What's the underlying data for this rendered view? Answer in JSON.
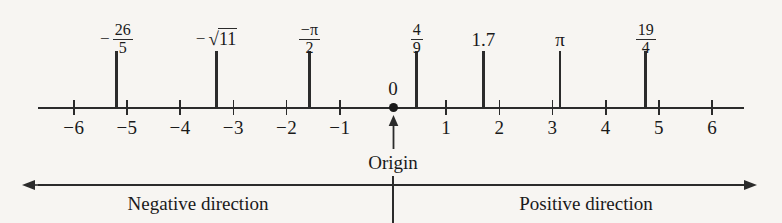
{
  "chart_data": {
    "type": "number-line",
    "title": "",
    "axis": {
      "min": -6.6,
      "max": 6.6,
      "origin_value": 0,
      "tick_step": 1,
      "tick_labels": [
        "−6",
        "−5",
        "−4",
        "−3",
        "−2",
        "−1",
        "1",
        "2",
        "3",
        "4",
        "5",
        "6"
      ],
      "tick_values": [
        -6,
        -5,
        -4,
        -3,
        -2,
        -1,
        1,
        2,
        3,
        4,
        5,
        6
      ],
      "grid": false
    },
    "plotted_points": [
      {
        "label_text": "-26/5",
        "value": -5.2,
        "kind": "fraction",
        "numerator": "26",
        "denominator": "5",
        "sign": "−",
        "sign_position": "outside"
      },
      {
        "label_text": "-sqrt(11)",
        "value": -3.3166,
        "kind": "radical",
        "radicand": "11",
        "sign": "−",
        "sign_position": "outside"
      },
      {
        "label_text": "-pi/2",
        "value": -1.5708,
        "kind": "fraction",
        "numerator": "−π",
        "denominator": "2",
        "sign": "",
        "sign_position": "numerator"
      },
      {
        "label_text": "4/9",
        "value": 0.4444,
        "kind": "fraction",
        "numerator": "4",
        "denominator": "9",
        "sign": "",
        "sign_position": "none"
      },
      {
        "label_text": "1.7",
        "value": 1.7,
        "kind": "decimal",
        "text": "1.7"
      },
      {
        "label_text": "pi",
        "value": 3.1416,
        "kind": "symbol",
        "text": "π"
      },
      {
        "label_text": "19/4",
        "value": 4.75,
        "kind": "fraction",
        "numerator": "19",
        "denominator": "4",
        "sign": "",
        "sign_position": "none"
      }
    ],
    "annotations": {
      "zero_label": "0",
      "origin_label": "Origin",
      "negative_direction_label": "Negative direction",
      "positive_direction_label": "Positive direction"
    },
    "colors": {
      "ink": "#2b2b2b",
      "paper": "#f7f5f2"
    }
  }
}
